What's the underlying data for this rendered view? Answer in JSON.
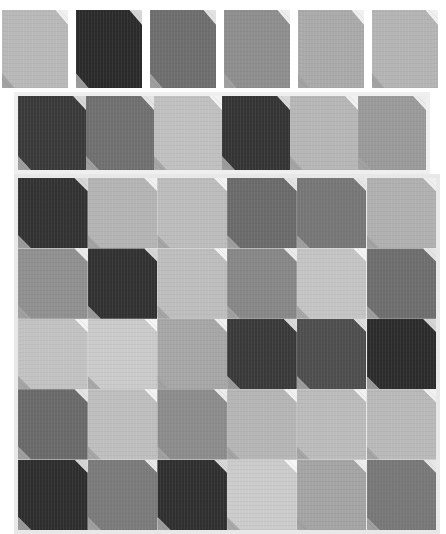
{
  "canvas": {
    "width": 446,
    "height": 534,
    "background_color": "#ffffff",
    "title": "Tile Swatch Grid"
  },
  "palette": {
    "very_dark": "#2b2b2b",
    "dark": "#3a3a3a",
    "mid_dark": "#5a5a5a",
    "mid": "#6e6e6e",
    "mid_light": "#8e8e8e",
    "light": "#a9a9a9",
    "lighter": "#b8b8b8",
    "lightest": "#c6c6c6",
    "pale": "#d2d2d2",
    "fold_highlight": "#f2f2f2",
    "fold_shadow": "#9c9c9c",
    "strip_background": "#efefef",
    "grid_background": "#e8e8e8"
  },
  "sections": {
    "top_row": {
      "label": "Top swatch row",
      "x": 2,
      "y": 10,
      "tile_width": 66,
      "tile_height": 78,
      "gap": 8,
      "count": 6,
      "tiles": [
        {
          "name": "tile-top-1",
          "color": "#b8b8b8",
          "fold_tr": "#f0f0f0",
          "fold_bl": "#a2a2a2"
        },
        {
          "name": "tile-top-2",
          "color": "#2b2b2b",
          "fold_tr": "#d6d6d6",
          "fold_bl": "#9b9b9b"
        },
        {
          "name": "tile-top-3",
          "color": "#6e6e6e",
          "fold_tr": "#e2e2e2",
          "fold_bl": "#9f9f9f"
        },
        {
          "name": "tile-top-4",
          "color": "#8e8e8e",
          "fold_tr": "#ededed",
          "fold_bl": "#a0a0a0"
        },
        {
          "name": "tile-top-5",
          "color": "#aaaaaa",
          "fold_tr": "#f0f0f0",
          "fold_bl": "#a3a3a3"
        },
        {
          "name": "tile-top-6",
          "color": "#b4b4b4",
          "fold_tr": "#f0f0f0",
          "fold_bl": "#a3a3a3"
        }
      ]
    },
    "middle_strip": {
      "label": "Middle contiguous strip",
      "x": 18,
      "y": 96,
      "tile_width": 68,
      "tile_height": 74,
      "count": 6,
      "background": "#efefef",
      "tiles": [
        {
          "name": "tile-strip-1",
          "color": "#3a3a3a",
          "fold_tr": "#d8d8d8",
          "fold_bl": "#9e9e9e"
        },
        {
          "name": "tile-strip-2",
          "color": "#707070",
          "fold_tr": "#e4e4e4",
          "fold_bl": "#9f9f9f"
        },
        {
          "name": "tile-strip-3",
          "color": "#c0c0c0",
          "fold_tr": "#f2f2f2",
          "fold_bl": "#a6a6a6"
        },
        {
          "name": "tile-strip-4",
          "color": "#353535",
          "fold_tr": "#d8d8d8",
          "fold_bl": "#9c9c9c"
        },
        {
          "name": "tile-strip-5",
          "color": "#b6b6b6",
          "fold_tr": "#f0f0f0",
          "fold_bl": "#a4a4a4"
        },
        {
          "name": "tile-strip-6",
          "color": "#9a9a9a",
          "fold_tr": "#ececec",
          "fold_bl": "#a2a2a2"
        }
      ]
    },
    "main_grid": {
      "label": "Main 6x5 tile grid",
      "x": 18,
      "y": 178,
      "tile_width": 69.7,
      "tile_height": 70.4,
      "columns": 6,
      "rows": 5,
      "background": "#e8e8e8",
      "rows_data": [
        {
          "row_index": 1,
          "tiles": [
            {
              "name": "tile-r1c1",
              "color": "#333333",
              "fold_tr": "#d6d6d6",
              "fold_bl": "#9b9b9b"
            },
            {
              "name": "tile-r1c2",
              "color": "#b4b4b4",
              "fold_tr": "#f0f0f0",
              "fold_bl": "#a3a3a3"
            },
            {
              "name": "tile-r1c3",
              "color": "#bcbcbc",
              "fold_tr": "#f1f1f1",
              "fold_bl": "#a5a5a5"
            },
            {
              "name": "tile-r1c4",
              "color": "#6b6b6b",
              "fold_tr": "#e3e3e3",
              "fold_bl": "#9f9f9f"
            },
            {
              "name": "tile-r1c5",
              "color": "#777777",
              "fold_tr": "#e6e6e6",
              "fold_bl": "#a0a0a0"
            },
            {
              "name": "tile-r1c6",
              "color": "#b0b0b0",
              "fold_tr": "#efefef",
              "fold_bl": "#a3a3a3"
            }
          ]
        },
        {
          "row_index": 2,
          "tiles": [
            {
              "name": "tile-r2c1",
              "color": "#909090",
              "fold_tr": "#ebebeb",
              "fold_bl": "#a1a1a1"
            },
            {
              "name": "tile-r2c2",
              "color": "#323232",
              "fold_tr": "#d6d6d6",
              "fold_bl": "#9b9b9b"
            },
            {
              "name": "tile-r2c3",
              "color": "#bdbdbd",
              "fold_tr": "#f2f2f2",
              "fold_bl": "#a5a5a5"
            },
            {
              "name": "tile-r2c4",
              "color": "#878787",
              "fold_tr": "#eaeaea",
              "fold_bl": "#a1a1a1"
            },
            {
              "name": "tile-r2c5",
              "color": "#c4c4c4",
              "fold_tr": "#f3f3f3",
              "fold_bl": "#a7a7a7"
            },
            {
              "name": "tile-r2c6",
              "color": "#6e6e6e",
              "fold_tr": "#e4e4e4",
              "fold_bl": "#9f9f9f"
            }
          ]
        },
        {
          "row_index": 3,
          "tiles": [
            {
              "name": "tile-r3c1",
              "color": "#c2c2c2",
              "fold_tr": "#f3f3f3",
              "fold_bl": "#a6a6a6"
            },
            {
              "name": "tile-r3c2",
              "color": "#cacaca",
              "fold_tr": "#f4f4f4",
              "fold_bl": "#a8a8a8"
            },
            {
              "name": "tile-r3c3",
              "color": "#a6a6a6",
              "fold_tr": "#eeeeee",
              "fold_bl": "#a2a2a2"
            },
            {
              "name": "tile-r3c4",
              "color": "#3a3a3a",
              "fold_tr": "#d8d8d8",
              "fold_bl": "#9c9c9c"
            },
            {
              "name": "tile-r3c5",
              "color": "#4e4e4e",
              "fold_tr": "#dcdcdc",
              "fold_bl": "#9d9d9d"
            },
            {
              "name": "tile-r3c6",
              "color": "#2c2c2c",
              "fold_tr": "#d5d5d5",
              "fold_bl": "#9a9a9a"
            }
          ]
        },
        {
          "row_index": 4,
          "tiles": [
            {
              "name": "tile-r4c1",
              "color": "#6a6a6a",
              "fold_tr": "#e3e3e3",
              "fold_bl": "#9f9f9f"
            },
            {
              "name": "tile-r4c2",
              "color": "#bebebe",
              "fold_tr": "#f2f2f2",
              "fold_bl": "#a6a6a6"
            },
            {
              "name": "tile-r4c3",
              "color": "#8c8c8c",
              "fold_tr": "#ebebeb",
              "fold_bl": "#a1a1a1"
            },
            {
              "name": "tile-r4c4",
              "color": "#b5b5b5",
              "fold_tr": "#f0f0f0",
              "fold_bl": "#a4a4a4"
            },
            {
              "name": "tile-r4c5",
              "color": "#bbbbbb",
              "fold_tr": "#f1f1f1",
              "fold_bl": "#a5a5a5"
            },
            {
              "name": "tile-r4c6",
              "color": "#b9b9b9",
              "fold_tr": "#f1f1f1",
              "fold_bl": "#a4a4a4"
            }
          ]
        },
        {
          "row_index": 5,
          "tiles": [
            {
              "name": "tile-r5c1",
              "color": "#2e2e2e",
              "fold_tr": "#d5d5d5",
              "fold_bl": "#9a9a9a"
            },
            {
              "name": "tile-r5c2",
              "color": "#7b7b7b",
              "fold_tr": "#e7e7e7",
              "fold_bl": "#a0a0a0"
            },
            {
              "name": "tile-r5c3",
              "color": "#303030",
              "fold_tr": "#d6d6d6",
              "fold_bl": "#9b9b9b"
            },
            {
              "name": "tile-r5c4",
              "color": "#cbcbcb",
              "fold_tr": "#f5f5f5",
              "fold_bl": "#a8a8a8"
            },
            {
              "name": "tile-r5c5",
              "color": "#a4a4a4",
              "fold_tr": "#ededed",
              "fold_bl": "#a2a2a2"
            },
            {
              "name": "tile-r5c6",
              "color": "#787878",
              "fold_tr": "#e6e6e6",
              "fold_bl": "#a0a0a0"
            }
          ]
        }
      ]
    }
  }
}
